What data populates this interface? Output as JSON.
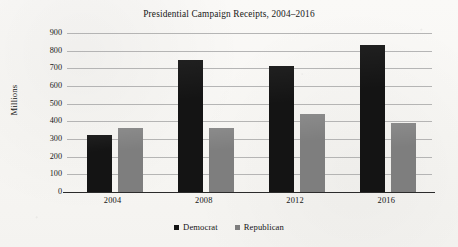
{
  "chart_data": {
    "type": "bar",
    "title": "Presidential Campaign Receipts, 2004–2016",
    "xlabel": "",
    "ylabel": "Millions",
    "categories": [
      "2004",
      "2008",
      "2012",
      "2016"
    ],
    "series": [
      {
        "name": "Democrat",
        "color": "#141414",
        "values": [
          325,
          745,
          715,
          830
        ]
      },
      {
        "name": "Republican",
        "color": "#7e7e7e",
        "values": [
          365,
          360,
          440,
          390
        ]
      }
    ],
    "ylim": [
      0,
      900
    ],
    "ytick_labels": [
      "900",
      "800",
      "700",
      "600",
      "500",
      "400",
      "300",
      "200",
      "100",
      "0"
    ],
    "ytick_values": [
      900,
      800,
      700,
      600,
      500,
      400,
      300,
      200,
      100,
      0
    ],
    "grid": true,
    "legend_position": "bottom",
    "legend_entries": [
      "Democrat",
      "Republican"
    ]
  }
}
